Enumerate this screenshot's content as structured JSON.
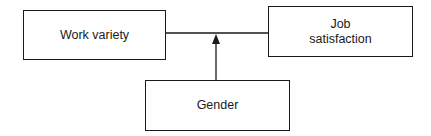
{
  "diagram": {
    "type": "moderation-model",
    "nodes": [
      {
        "id": "work_variety",
        "label_lines": [
          "Work variety"
        ]
      },
      {
        "id": "job_satisfaction",
        "label_lines": [
          "Job",
          "satisfaction"
        ]
      },
      {
        "id": "gender",
        "label_lines": [
          "Gender"
        ]
      }
    ],
    "edges": [
      {
        "from": "work_variety",
        "to": "job_satisfaction",
        "style": "line"
      },
      {
        "from": "gender",
        "to": "work_variety->job_satisfaction",
        "style": "arrow"
      }
    ],
    "colors": {
      "stroke": "#1a1a1a",
      "background": "#ffffff"
    }
  }
}
